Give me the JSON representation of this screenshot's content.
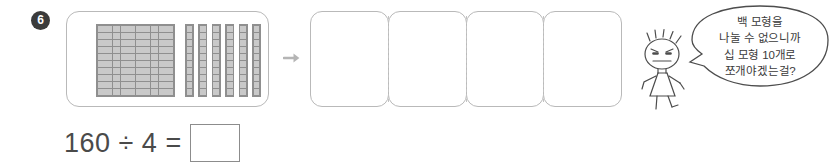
{
  "problem": {
    "number": "6"
  },
  "model": {
    "hundred_block": {
      "label": "hundred-flat",
      "rows": 10,
      "cols": 10,
      "value": 100,
      "fill_color": "#c9c9c9",
      "line_color": "#8f8f8f"
    },
    "ten_rods": {
      "label": "ten-rod",
      "count": 6,
      "segments_per_rod": 10,
      "value": 60,
      "fill_color": "#c9c9c9",
      "line_color": "#8f8f8f"
    },
    "total_value": 160
  },
  "arrow": {
    "icon": "arrow-right-icon",
    "color": "#b5b5b5"
  },
  "groups": {
    "count": 4,
    "boxes": [
      {
        "label": "group-1",
        "content": ""
      },
      {
        "label": "group-2",
        "content": ""
      },
      {
        "label": "group-3",
        "content": ""
      },
      {
        "label": "group-4",
        "content": ""
      }
    ]
  },
  "character": {
    "name": "student-character",
    "expression": "frowning"
  },
  "speech_bubble": {
    "lines": [
      "백 모형을",
      "나눌 수 없으니까",
      "십 모형 10개로",
      "쪼개야겠는걸?"
    ]
  },
  "equation": {
    "expression": "160 ÷ 4 =",
    "answer": ""
  },
  "colors": {
    "background": "#ffffff",
    "outline": "#b9b9b9",
    "text": "#4a4a4a",
    "badge": "#3b3b3b"
  }
}
